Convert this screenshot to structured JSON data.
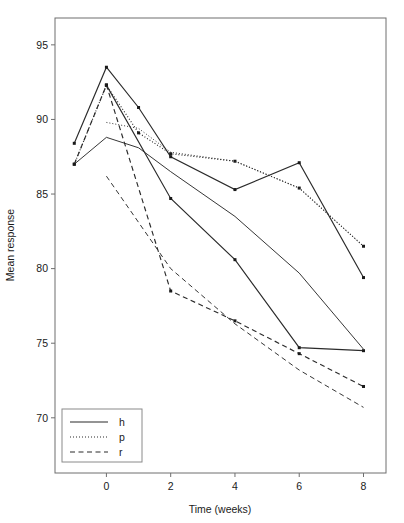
{
  "chart_data": {
    "type": "line",
    "title": "",
    "xlabel": "Time (weeks)",
    "ylabel": "Mean response",
    "xlim": [
      -1.6,
      8.7
    ],
    "ylim": [
      66.3,
      96.8
    ],
    "xticks": [
      0,
      2,
      4,
      6,
      8
    ],
    "xtick_labels": [
      "0",
      "2",
      "4",
      "6",
      "8"
    ],
    "yticks": [
      70,
      75,
      80,
      85,
      90,
      95
    ],
    "ytick_labels": [
      "70",
      "75",
      "80",
      "85",
      "90",
      "95"
    ],
    "grid": false,
    "legend_position": "bottom-left",
    "legend": [
      {
        "label": "h",
        "style": "solid"
      },
      {
        "label": "p",
        "style": "dotted"
      },
      {
        "label": "r",
        "style": "dashed"
      }
    ],
    "series": [
      {
        "name": "h",
        "role": "observed",
        "style": "solid",
        "markers": true,
        "x": [
          -1,
          0,
          1,
          2,
          4,
          6,
          8
        ],
        "values": [
          88.4,
          93.5,
          90.8,
          87.5,
          85.3,
          87.1,
          79.4
        ]
      },
      {
        "name": "h",
        "role": "fitted",
        "style": "solid",
        "markers": false,
        "x": [
          -1,
          0,
          1,
          2,
          4,
          6,
          8
        ],
        "values": [
          87.0,
          88.8,
          88.1,
          86.5,
          83.5,
          79.7,
          74.6
        ]
      },
      {
        "name": "p",
        "role": "observed",
        "style": "dotted",
        "markers": true,
        "x": [
          -1,
          0,
          1,
          2,
          4,
          6,
          8
        ],
        "values": [
          87.0,
          92.3,
          89.1,
          87.7,
          87.2,
          85.4,
          81.5
        ]
      },
      {
        "name": "p",
        "role": "fitted",
        "style": "dotted",
        "markers": false,
        "x": [
          0,
          1,
          2,
          4,
          6,
          8
        ],
        "values": [
          89.8,
          89.4,
          87.8,
          87.2,
          85.4,
          81.5
        ]
      },
      {
        "name": "r",
        "role": "observed",
        "style": "dashed",
        "markers": true,
        "x": [
          -1,
          0,
          2,
          4,
          6,
          8
        ],
        "values": [
          87.0,
          92.3,
          78.5,
          76.5,
          74.3,
          72.1
        ]
      },
      {
        "name": "r",
        "role": "fitted",
        "style": "dashed",
        "markers": false,
        "x": [
          0,
          2,
          4,
          6,
          8
        ],
        "values": [
          86.2,
          80.0,
          76.3,
          73.2,
          70.7
        ]
      },
      {
        "name": "h",
        "role": "observed-lower",
        "style": "solid",
        "markers": true,
        "x": [
          0,
          2,
          4,
          6,
          8
        ],
        "values": [
          92.3,
          84.7,
          80.6,
          74.7,
          74.5
        ]
      }
    ]
  }
}
